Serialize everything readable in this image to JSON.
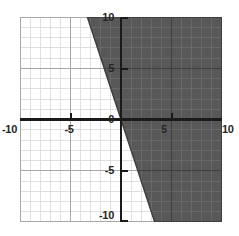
{
  "chart_data": {
    "type": "line",
    "title": "",
    "xlabel": "",
    "ylabel": "",
    "xlim": [
      -10,
      10
    ],
    "ylim": [
      -10,
      10
    ],
    "grid": true,
    "grid_minor_step": 1,
    "grid_major_step": 5,
    "legend": "none",
    "x_ticks": [
      -10,
      -5,
      0,
      5,
      10
    ],
    "y_ticks": [
      -10,
      -5,
      0,
      5,
      10
    ],
    "x_tick_labels": [
      "-10",
      "-5",
      "0",
      "5",
      "10"
    ],
    "y_tick_labels": [
      "-10",
      "-5",
      "0",
      "5",
      "10"
    ],
    "series": [
      {
        "name": "boundary-line",
        "kind": "line",
        "equation": "y = -3x",
        "slope": -3,
        "intercept": 0,
        "style": "solid",
        "endpoints": [
          {
            "x": -3.333,
            "y": 10
          },
          {
            "x": 3.333,
            "y": -10
          }
        ],
        "points": [
          {
            "x": -3.333,
            "y": 10
          },
          {
            "x": -2,
            "y": 6
          },
          {
            "x": -1,
            "y": 3
          },
          {
            "x": 0,
            "y": 0
          },
          {
            "x": 1,
            "y": -3
          },
          {
            "x": 2,
            "y": -6
          },
          {
            "x": 3.333,
            "y": -10
          }
        ]
      }
    ],
    "shaded_region": {
      "name": "solution-region",
      "inequality": "y <= -3x",
      "description": "Half-plane to the right of and below the line y = -3x",
      "fill_color": "#585858",
      "polygon": [
        {
          "x": -3.333,
          "y": 10
        },
        {
          "x": 10,
          "y": 10
        },
        {
          "x": 10,
          "y": -10
        },
        {
          "x": 3.333,
          "y": -10
        }
      ]
    },
    "colors": {
      "background": "#ffffff",
      "shaded_fill": "#585858",
      "axis": "#1a1a1a",
      "boundary_line": "#3d3d3d",
      "grid_minor": "#d8d8d8",
      "grid_major": "#a8a8a8",
      "grid_minor_on_fill": "#6d6d6d",
      "grid_major_on_fill": "#484848",
      "tick_label": "#262626"
    }
  },
  "axis_labels": {
    "x_neg10": "-10",
    "x_neg5": "-5",
    "x_pos5": "5",
    "x_pos10": "10",
    "y_pos10": "10",
    "y_pos5": "5",
    "y_zero": "0",
    "y_neg5": "-5",
    "y_neg10": "-10"
  }
}
